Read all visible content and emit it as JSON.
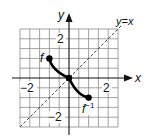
{
  "diagram": {
    "type": "function-and-inverse-graph",
    "axes": {
      "x_label": "x",
      "y_label": "y"
    },
    "tick_labels": {
      "x_pos": "2",
      "x_neg": "−2",
      "y_pos": "2",
      "y_neg": "−2"
    },
    "grid": {
      "x_range": [
        -2.5,
        2.5
      ],
      "y_range": [
        -2.5,
        2.5
      ],
      "cell_size_units": 0.5
    },
    "reference_line": {
      "label": "y=x",
      "style": "dashed"
    },
    "curves": [
      {
        "name": "f",
        "label": "f",
        "from": [
          -1,
          1
        ],
        "to": [
          0,
          0
        ],
        "endpoints": "filled"
      },
      {
        "name": "f_inverse",
        "label": "f",
        "superscript": "−1",
        "from": [
          0,
          0
        ],
        "to": [
          1,
          -1
        ],
        "endpoints": "filled"
      }
    ],
    "colors": {
      "grid": "#777777",
      "axes": "#111111",
      "curve": "#000000",
      "background": "#ffffff"
    }
  }
}
